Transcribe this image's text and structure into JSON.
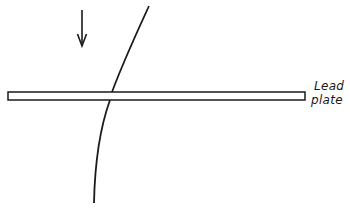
{
  "diagram": {
    "labels": {
      "plate_line1": "Lead",
      "plate_line2": "plate"
    },
    "colors": {
      "stroke": "#1a1a1a",
      "background": "#ffffff",
      "plate_fill": "#ffffff"
    },
    "elements": {
      "incident_arrow": "arrow pointing downward",
      "particle_track": "curved track crossing the lead plate",
      "lead_plate": "thin horizontal plate"
    }
  }
}
